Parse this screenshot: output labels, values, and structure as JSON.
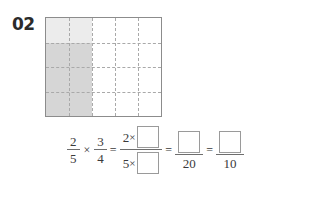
{
  "problem": {
    "number": "02"
  },
  "area_model": {
    "columns": 5,
    "rows": 4,
    "shade_light_color": "#ececec",
    "shade_dark_color": "#d6d6d6",
    "border_color": "#8c8c8c",
    "gridline_color": "#a9a9a9",
    "shaded_columns": 2,
    "shaded_rows": 4,
    "light_rows": 1
  },
  "equation": {
    "fraction_1": {
      "numerator": "2",
      "denominator": "5"
    },
    "multiply_symbol": "×",
    "fraction_2": {
      "numerator": "3",
      "denominator": "4"
    },
    "equals_symbol": "=",
    "fraction_3": {
      "numerator_factor": "2",
      "numerator_times": "×",
      "numerator_box": "",
      "denominator_factor": "5",
      "denominator_times": "×",
      "denominator_box": ""
    },
    "fraction_4": {
      "numerator_box": "",
      "denominator": "20"
    },
    "fraction_5": {
      "numerator_box": "",
      "denominator": "10"
    }
  }
}
